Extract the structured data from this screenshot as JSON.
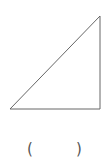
{
  "figure": {
    "shape": "right-triangle",
    "vertices": {
      "bottom_left": [
        10,
        109
      ],
      "top_right": [
        100,
        16
      ],
      "bottom_right": [
        100,
        109
      ]
    },
    "stroke_color": "#666666",
    "stroke_width": 1
  },
  "answer": {
    "open_paren": "(",
    "value": "",
    "close_paren": ")"
  }
}
